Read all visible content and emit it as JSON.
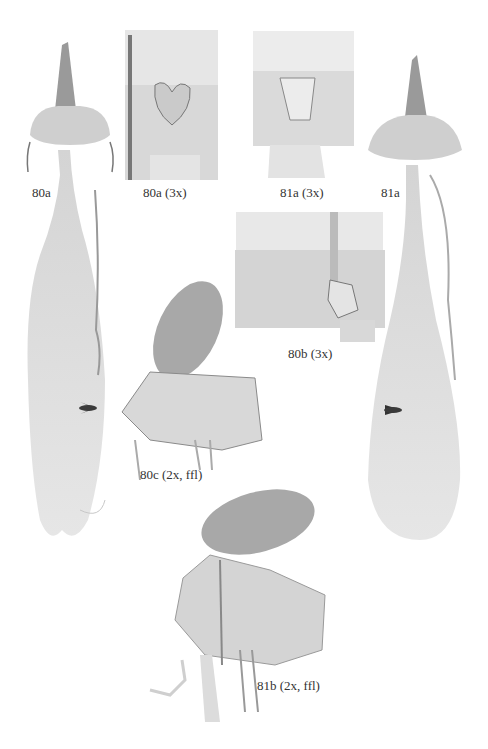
{
  "plate": {
    "figures": [
      {
        "id": "80a",
        "label": "80a"
      },
      {
        "id": "80a-3x",
        "label": "80a (3x)"
      },
      {
        "id": "81a-3x",
        "label": "81a (3x)"
      },
      {
        "id": "81a",
        "label": "81a"
      },
      {
        "id": "80b-3x",
        "label": "80b (3x)"
      },
      {
        "id": "80c",
        "label": "80c (2x, ffl)"
      },
      {
        "id": "81b",
        "label": "81b (2x, ffl)"
      }
    ]
  }
}
